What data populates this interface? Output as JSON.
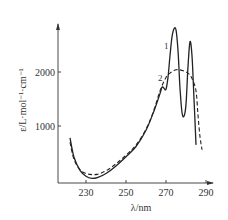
{
  "chart_data": {
    "type": "line",
    "title": "",
    "xlabel": "λ/nm",
    "ylabel": "ε/L·mol⁻¹·cm⁻¹",
    "xlim": [
      219,
      292
    ],
    "ylim": [
      0,
      2800
    ],
    "x_ticks": [
      "230",
      "250",
      "270",
      "290"
    ],
    "y_ticks": [
      "1000",
      "2000"
    ],
    "grid": false,
    "legend": "inline curve labels",
    "series": [
      {
        "name": "1",
        "style": "solid",
        "points": [
          [
            222,
            780
          ],
          [
            224,
            420
          ],
          [
            227,
            180
          ],
          [
            230,
            70
          ],
          [
            233,
            30
          ],
          [
            236,
            50
          ],
          [
            240,
            120
          ],
          [
            245,
            260
          ],
          [
            250,
            430
          ],
          [
            255,
            620
          ],
          [
            260,
            920
          ],
          [
            264,
            1280
          ],
          [
            267,
            1600
          ],
          [
            268,
            1720
          ],
          [
            269,
            1700
          ],
          [
            270,
            1680
          ],
          [
            271,
            1900
          ],
          [
            272,
            2300
          ],
          [
            273,
            2650
          ],
          [
            274,
            2800
          ],
          [
            275,
            2780
          ],
          [
            276,
            2400
          ],
          [
            277,
            1700
          ],
          [
            278,
            1250
          ],
          [
            279,
            1180
          ],
          [
            280,
            1400
          ],
          [
            281,
            2100
          ],
          [
            282,
            2560
          ],
          [
            283,
            2300
          ],
          [
            284,
            1500
          ],
          [
            285,
            650
          ]
        ]
      },
      {
        "name": "2",
        "style": "dashed",
        "points": [
          [
            222,
            700
          ],
          [
            224,
            380
          ],
          [
            227,
            190
          ],
          [
            230,
            120
          ],
          [
            233,
            100
          ],
          [
            236,
            110
          ],
          [
            240,
            170
          ],
          [
            245,
            300
          ],
          [
            250,
            460
          ],
          [
            255,
            650
          ],
          [
            260,
            940
          ],
          [
            264,
            1300
          ],
          [
            267,
            1650
          ],
          [
            270,
            1900
          ],
          [
            272,
            1980
          ],
          [
            275,
            2040
          ],
          [
            278,
            2030
          ],
          [
            281,
            1980
          ],
          [
            283,
            1880
          ],
          [
            285,
            1650
          ],
          [
            286,
            1200
          ],
          [
            287,
            800
          ],
          [
            288,
            560
          ]
        ]
      }
    ],
    "annotations": [
      {
        "text": "1",
        "x": 268,
        "y": 2460
      },
      {
        "text": "2",
        "x": 266,
        "y": 1880
      }
    ]
  }
}
